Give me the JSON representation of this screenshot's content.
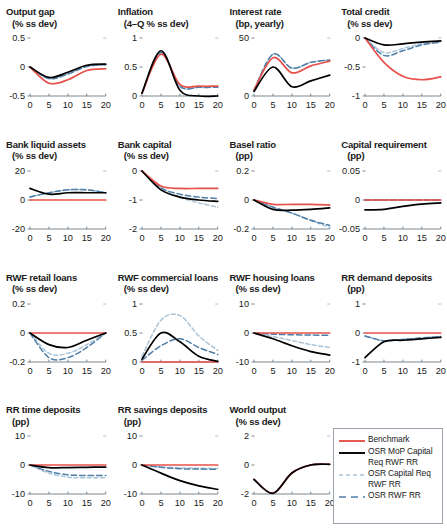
{
  "figure": {
    "type": "multi-panel-line-chart",
    "rows": 4,
    "cols": 4,
    "xlabel": "",
    "x_ticks": [
      0,
      5,
      10,
      15,
      20
    ],
    "colors": {
      "benchmark": "#e8504a",
      "osr_mop": "#000000",
      "osr_capital": "#aac4d8",
      "osr_rwf_rr": "#4f7fa8"
    }
  },
  "legend": {
    "position": "bottom-right",
    "entries": [
      {
        "label": "Benchmark",
        "color": "#e8504a",
        "style": "solid"
      },
      {
        "label": "OSR MoP Capital Req RWF RR",
        "color": "#000000",
        "style": "solid"
      },
      {
        "label": "OSR Capital Req RWF RR",
        "color": "#aac4d8",
        "style": "dashed"
      },
      {
        "label": "OSR RWF RR",
        "color": "#4f7fa8",
        "style": "dashed-long"
      }
    ]
  },
  "chart_data": [
    {
      "type": "line",
      "title": "Output gap",
      "subtitle": "(% ss dev)",
      "ylabel": "% ss dev",
      "xlabel": "",
      "ylim": [
        -0.5,
        0.5
      ],
      "y_ticks": [
        "0.5",
        "0",
        "-0.5"
      ],
      "y_tick_values": [
        0.5,
        0,
        -0.5
      ],
      "x": [
        0,
        5,
        10,
        15,
        20
      ],
      "xlim": [
        0,
        20
      ],
      "series": [
        {
          "name": "Benchmark",
          "values": [
            0,
            -0.28,
            -0.22,
            -0.06,
            -0.03
          ]
        },
        {
          "name": "OSR MoP Capital Req RWF RR",
          "values": [
            0,
            -0.18,
            -0.09,
            0.03,
            0.05
          ]
        },
        {
          "name": "OSR Capital Req RWF RR",
          "values": [
            0,
            -0.2,
            -0.12,
            0.01,
            0.04
          ]
        },
        {
          "name": "OSR RWF RR",
          "values": [
            0,
            -0.2,
            -0.12,
            0.01,
            0.04
          ]
        }
      ]
    },
    {
      "type": "line",
      "title": "Inflation",
      "subtitle": "(4–Q % ss dev)",
      "ylabel": "4-Q % ss dev",
      "xlabel": "",
      "ylim": [
        0,
        1
      ],
      "y_ticks": [
        "1",
        "0.5",
        "0"
      ],
      "y_tick_values": [
        1,
        0.5,
        0
      ],
      "x": [
        0,
        5,
        10,
        15,
        20
      ],
      "xlim": [
        0,
        20
      ],
      "series": [
        {
          "name": "Benchmark",
          "values": [
            0.05,
            0.72,
            0.2,
            0.17,
            0.17
          ]
        },
        {
          "name": "OSR MoP Capital Req RWF RR",
          "values": [
            0.05,
            0.78,
            0.1,
            0.0,
            0.0
          ]
        },
        {
          "name": "OSR Capital Req RWF RR",
          "values": [
            0.05,
            0.75,
            0.17,
            0.15,
            0.15
          ]
        },
        {
          "name": "OSR RWF RR",
          "values": [
            0.05,
            0.75,
            0.17,
            0.15,
            0.15
          ]
        }
      ]
    },
    {
      "type": "line",
      "title": "Interest rate",
      "subtitle": "(bp, yearly)",
      "ylabel": "bp, yearly",
      "xlabel": "",
      "ylim": [
        0,
        50
      ],
      "y_ticks": [
        "50",
        "0"
      ],
      "y_tick_values": [
        50,
        0
      ],
      "x": [
        0,
        5,
        10,
        15,
        20
      ],
      "xlim": [
        0,
        20
      ],
      "series": [
        {
          "name": "Benchmark",
          "values": [
            5,
            33,
            20,
            26,
            30
          ]
        },
        {
          "name": "OSR MoP Capital Req RWF RR",
          "values": [
            4,
            25,
            8,
            13,
            18
          ]
        },
        {
          "name": "OSR Capital Req RWF RR",
          "values": [
            5,
            36,
            24,
            29,
            31
          ]
        },
        {
          "name": "OSR RWF RR",
          "values": [
            5,
            36,
            24,
            29,
            31
          ]
        }
      ]
    },
    {
      "type": "line",
      "title": "Total credit",
      "subtitle": "(% ss dev)",
      "ylabel": "% ss dev",
      "xlabel": "",
      "ylim": [
        -1,
        0
      ],
      "y_ticks": [
        "0",
        "-0.5",
        "-1"
      ],
      "y_tick_values": [
        0,
        -0.5,
        -1
      ],
      "x": [
        0,
        5,
        10,
        15,
        20
      ],
      "xlim": [
        0,
        20
      ],
      "series": [
        {
          "name": "Benchmark",
          "values": [
            0,
            -0.42,
            -0.66,
            -0.72,
            -0.67
          ]
        },
        {
          "name": "OSR MoP Capital Req RWF RR",
          "values": [
            0,
            -0.12,
            -0.1,
            -0.07,
            -0.05
          ]
        },
        {
          "name": "OSR Capital Req RWF RR",
          "values": [
            0,
            -0.25,
            -0.18,
            -0.1,
            -0.06
          ]
        },
        {
          "name": "OSR RWF RR",
          "values": [
            0,
            -0.3,
            -0.22,
            -0.12,
            -0.07
          ]
        }
      ]
    },
    {
      "type": "line",
      "title": "Bank liquid assets",
      "subtitle": "(% ss dev)",
      "ylabel": "% ss dev",
      "xlabel": "",
      "ylim": [
        -20,
        20
      ],
      "y_ticks": [
        "20",
        "0",
        "-20"
      ],
      "y_tick_values": [
        20,
        0,
        -20
      ],
      "x": [
        0,
        5,
        10,
        15,
        20
      ],
      "xlim": [
        0,
        20
      ],
      "series": [
        {
          "name": "Benchmark",
          "values": [
            0,
            0,
            0,
            0,
            0
          ]
        },
        {
          "name": "OSR MoP Capital Req RWF RR",
          "values": [
            8,
            4,
            5,
            5,
            5
          ]
        },
        {
          "name": "OSR Capital Req RWF RR",
          "values": [
            2,
            5,
            7,
            7,
            5
          ]
        },
        {
          "name": "OSR RWF RR",
          "values": [
            2,
            5,
            7,
            7,
            5
          ]
        }
      ]
    },
    {
      "type": "line",
      "title": "Bank capital",
      "subtitle": "(% ss dev)",
      "ylabel": "% ss dev",
      "xlabel": "",
      "ylim": [
        -2,
        0
      ],
      "y_ticks": [
        "0",
        "-1",
        "-2"
      ],
      "y_tick_values": [
        0,
        -1,
        -2
      ],
      "x": [
        0,
        5,
        10,
        15,
        20
      ],
      "xlim": [
        0,
        20
      ],
      "series": [
        {
          "name": "Benchmark",
          "values": [
            0,
            -0.52,
            -0.6,
            -0.6,
            -0.6
          ]
        },
        {
          "name": "OSR MoP Capital Req RWF RR",
          "values": [
            0,
            -0.65,
            -0.9,
            -1.0,
            -1.05
          ]
        },
        {
          "name": "OSR Capital Req RWF RR",
          "values": [
            0,
            -0.6,
            -0.9,
            -1.1,
            -1.25
          ]
        },
        {
          "name": "OSR RWF RR",
          "values": [
            0,
            -0.58,
            -0.8,
            -0.9,
            -0.95
          ]
        }
      ]
    },
    {
      "type": "line",
      "title": "Basel ratio",
      "subtitle": "(pp)",
      "ylabel": "pp",
      "xlabel": "",
      "ylim": [
        -0.2,
        0.2
      ],
      "y_ticks": [
        "0.2",
        "0",
        "-0.2"
      ],
      "y_tick_values": [
        0.2,
        0,
        -0.2
      ],
      "x": [
        0,
        5,
        10,
        15,
        20
      ],
      "xlim": [
        0,
        20
      ],
      "series": [
        {
          "name": "Benchmark",
          "values": [
            0,
            -0.03,
            -0.03,
            -0.03,
            -0.035
          ]
        },
        {
          "name": "OSR MoP Capital Req RWF RR",
          "values": [
            0,
            -0.065,
            -0.07,
            -0.065,
            -0.055
          ]
        },
        {
          "name": "OSR Capital Req RWF RR",
          "values": [
            0,
            -0.05,
            -0.09,
            -0.14,
            -0.19
          ]
        },
        {
          "name": "OSR RWF RR",
          "values": [
            0,
            -0.05,
            -0.09,
            -0.14,
            -0.175
          ]
        }
      ]
    },
    {
      "type": "line",
      "title": "Capital requirement",
      "subtitle": "(pp)",
      "ylabel": "pp",
      "xlabel": "",
      "ylim": [
        -0.05,
        0.05
      ],
      "y_ticks": [
        "0.05",
        "0",
        "-0.05"
      ],
      "y_tick_values": [
        0.05,
        0,
        -0.05
      ],
      "x": [
        0,
        5,
        10,
        15,
        20
      ],
      "xlim": [
        0,
        20
      ],
      "series": [
        {
          "name": "Benchmark",
          "values": [
            0,
            0,
            0,
            0,
            0
          ]
        },
        {
          "name": "OSR MoP Capital Req RWF RR",
          "values": [
            -0.017,
            -0.016,
            -0.011,
            -0.007,
            -0.005
          ]
        },
        {
          "name": "OSR Capital Req RWF RR",
          "values": [
            0,
            0,
            0,
            0,
            0
          ]
        },
        {
          "name": "OSR RWF RR",
          "values": [
            0,
            0,
            0,
            0,
            0
          ]
        }
      ]
    },
    {
      "type": "line",
      "title": "RWF retail loans",
      "subtitle": "(% ss dev)",
      "ylabel": "% ss dev",
      "xlabel": "",
      "ylim": [
        -0.2,
        0.2
      ],
      "y_ticks": [
        "0.2",
        "0",
        "-0.2"
      ],
      "y_tick_values": [
        0.2,
        0,
        -0.2
      ],
      "x": [
        0,
        5,
        10,
        15,
        20
      ],
      "xlim": [
        0,
        20
      ],
      "series": [
        {
          "name": "Benchmark",
          "values": [
            0,
            0,
            0,
            0,
            0
          ]
        },
        {
          "name": "OSR MoP Capital Req RWF RR",
          "values": [
            0,
            -0.08,
            -0.1,
            -0.05,
            0.0
          ]
        },
        {
          "name": "OSR Capital Req RWF RR",
          "values": [
            0,
            -0.14,
            -0.14,
            -0.08,
            0.0
          ]
        },
        {
          "name": "OSR RWF RR",
          "values": [
            0,
            -0.17,
            -0.17,
            -0.1,
            0.0
          ]
        }
      ]
    },
    {
      "type": "line",
      "title": "RWF commercial loans",
      "subtitle": "(% ss dev)",
      "ylabel": "% ss dev",
      "xlabel": "",
      "ylim": [
        0,
        1
      ],
      "y_ticks": [
        "1",
        "0.5",
        "0"
      ],
      "y_tick_values": [
        1,
        0.5,
        0
      ],
      "x": [
        0,
        5,
        10,
        15,
        20
      ],
      "xlim": [
        0,
        20
      ],
      "series": [
        {
          "name": "Benchmark",
          "values": [
            0,
            0,
            0,
            0,
            0
          ]
        },
        {
          "name": "OSR MoP Capital Req RWF RR",
          "values": [
            0.05,
            0.5,
            0.35,
            0.1,
            0.01
          ]
        },
        {
          "name": "OSR Capital Req RWF RR",
          "values": [
            0.1,
            0.72,
            0.8,
            0.45,
            0.2
          ]
        },
        {
          "name": "OSR RWF RR",
          "values": [
            0.03,
            0.28,
            0.4,
            0.25,
            0.13
          ]
        }
      ]
    },
    {
      "type": "line",
      "title": "RWF housing loans",
      "subtitle": "(% ss dev)",
      "ylabel": "% ss dev",
      "xlabel": "",
      "ylim": [
        -10,
        10
      ],
      "y_ticks": [
        "10",
        "0",
        "-10"
      ],
      "y_tick_values": [
        10,
        0,
        -10
      ],
      "x": [
        0,
        5,
        10,
        15,
        20
      ],
      "xlim": [
        0,
        20
      ],
      "series": [
        {
          "name": "Benchmark",
          "values": [
            0,
            0,
            0,
            0,
            0
          ]
        },
        {
          "name": "OSR MoP Capital Req RWF RR",
          "values": [
            0,
            -2.0,
            -4.4,
            -6.4,
            -7.6
          ]
        },
        {
          "name": "OSR Capital Req RWF RR",
          "values": [
            0,
            -1.2,
            -2.6,
            -4.0,
            -5.0
          ]
        },
        {
          "name": "OSR RWF RR",
          "values": [
            0,
            -0.4,
            -0.6,
            -0.7,
            -0.8
          ]
        }
      ]
    },
    {
      "type": "line",
      "title": "RR demand deposits",
      "subtitle": "(pp)",
      "ylabel": "pp",
      "xlabel": "",
      "ylim": [
        -1,
        1
      ],
      "y_ticks": [
        "1",
        "0",
        "-1"
      ],
      "y_tick_values": [
        1,
        0,
        -1
      ],
      "x": [
        0,
        5,
        10,
        15,
        20
      ],
      "xlim": [
        0,
        20
      ],
      "series": [
        {
          "name": "Benchmark",
          "values": [
            0,
            0,
            0,
            0,
            0
          ]
        },
        {
          "name": "OSR MoP Capital Req RWF RR",
          "values": [
            -0.85,
            -0.3,
            -0.25,
            -0.2,
            -0.15
          ]
        },
        {
          "name": "OSR Capital Req RWF RR",
          "values": [
            -0.1,
            -0.27,
            -0.22,
            -0.17,
            -0.12
          ]
        },
        {
          "name": "OSR RWF RR",
          "values": [
            -0.1,
            -0.27,
            -0.22,
            -0.17,
            -0.12
          ]
        }
      ]
    },
    {
      "type": "line",
      "title": "RR time deposits",
      "subtitle": "(pp)",
      "ylabel": "pp",
      "xlabel": "",
      "ylim": [
        -10,
        10
      ],
      "y_ticks": [
        "10",
        "0",
        "-10"
      ],
      "y_tick_values": [
        10,
        0,
        -10
      ],
      "x": [
        0,
        5,
        10,
        15,
        20
      ],
      "xlim": [
        0,
        20
      ],
      "series": [
        {
          "name": "Benchmark",
          "values": [
            0,
            0,
            0,
            0,
            0
          ]
        },
        {
          "name": "OSR MoP Capital Req RWF RR",
          "values": [
            0,
            -0.9,
            -0.9,
            -0.8,
            -0.7
          ]
        },
        {
          "name": "OSR Capital Req RWF RR",
          "values": [
            0,
            -2.8,
            -4.2,
            -4.4,
            -4.4
          ]
        },
        {
          "name": "OSR RWF RR",
          "values": [
            0,
            -2.2,
            -3.4,
            -3.6,
            -3.6
          ]
        }
      ]
    },
    {
      "type": "line",
      "title": "RR savings deposits",
      "subtitle": "(pp)",
      "ylabel": "pp",
      "xlabel": "",
      "ylim": [
        -10,
        10
      ],
      "y_ticks": [
        "10",
        "0",
        "-10"
      ],
      "y_tick_values": [
        10,
        0,
        -10
      ],
      "x": [
        0,
        5,
        10,
        15,
        20
      ],
      "xlim": [
        0,
        20
      ],
      "series": [
        {
          "name": "Benchmark",
          "values": [
            0,
            0,
            0,
            0,
            0
          ]
        },
        {
          "name": "OSR MoP Capital Req RWF RR",
          "values": [
            0,
            -2.8,
            -5.4,
            -7.2,
            -8.4
          ]
        },
        {
          "name": "OSR Capital Req RWF RR",
          "values": [
            0,
            -0.7,
            -1.0,
            -1.1,
            -1.2
          ]
        },
        {
          "name": "OSR RWF RR",
          "values": [
            0,
            -0.8,
            -1.3,
            -1.4,
            -1.5
          ]
        }
      ]
    },
    {
      "type": "line",
      "title": "World output",
      "subtitle": "(% ss dev)",
      "ylabel": "% ss dev",
      "xlabel": "",
      "ylim": [
        -2,
        2
      ],
      "y_ticks": [
        "2",
        "0",
        "-2"
      ],
      "y_tick_values": [
        2,
        0,
        -2
      ],
      "x": [
        0,
        5,
        10,
        15,
        20
      ],
      "xlim": [
        0,
        20
      ],
      "series": [
        {
          "name": "Benchmark",
          "values": [
            -1.0,
            -1.95,
            -0.55,
            0.0,
            0.05
          ]
        },
        {
          "name": "OSR MoP Capital Req RWF RR",
          "values": [
            -1.0,
            -1.95,
            -0.55,
            0.0,
            0.05
          ]
        },
        {
          "name": "OSR Capital Req RWF RR",
          "values": [
            -1.0,
            -1.95,
            -0.55,
            0.0,
            0.05
          ]
        },
        {
          "name": "OSR RWF RR",
          "values": [
            -1.0,
            -1.95,
            -0.55,
            0.0,
            0.05
          ]
        }
      ]
    }
  ]
}
